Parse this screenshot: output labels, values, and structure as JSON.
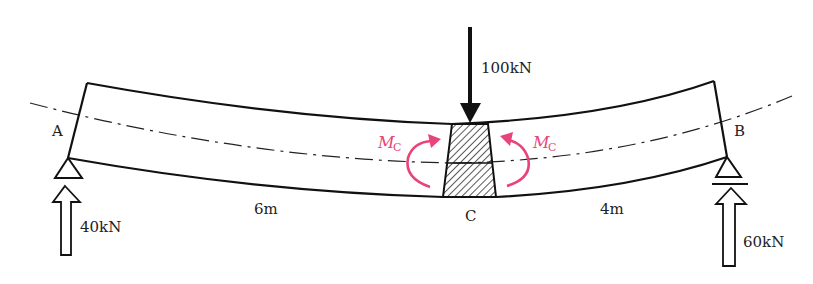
{
  "diagram": {
    "supports": {
      "A": {
        "label": "A",
        "type": "pin",
        "reaction": "40kN"
      },
      "B": {
        "label": "B",
        "type": "roller",
        "reaction": "60kN"
      }
    },
    "load": {
      "label": "100kN",
      "position": "C",
      "direction": "down"
    },
    "section": {
      "label": "C"
    },
    "spans": [
      {
        "from": "A",
        "to": "C",
        "length": "6m"
      },
      {
        "from": "C",
        "to": "B",
        "length": "4m"
      }
    ],
    "moments": [
      {
        "symbol": "M",
        "subscript": "C",
        "side": "left",
        "rotation": "clockwise"
      },
      {
        "symbol": "M",
        "subscript": "C",
        "side": "right",
        "rotation": "counterclockwise"
      }
    ],
    "colors": {
      "line": "#111111",
      "moment": "#e8447a"
    }
  }
}
